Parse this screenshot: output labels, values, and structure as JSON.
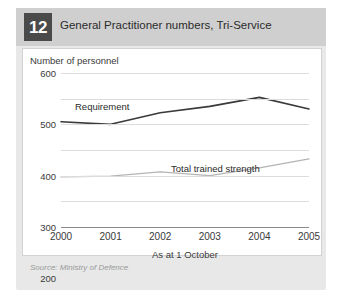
{
  "card": {
    "badge_number": "12",
    "title": "General Practitioner numbers, Tri-Service",
    "source": "Source: Ministry of Defence",
    "header_bg": "#cfcfcf",
    "badge_bg": "#4a4a4a",
    "card_bg": "#e8e8e8"
  },
  "chart_data": {
    "type": "line",
    "title": "General Practitioner numbers, Tri-Service",
    "xlabel": "As at 1 October",
    "ylabel": "Number of personnel",
    "categories": [
      "2000",
      "2001",
      "2002",
      "2003",
      "2004",
      "2005"
    ],
    "x": [
      2000,
      2001,
      2002,
      2003,
      2004,
      2005
    ],
    "ylim": [
      0,
      600
    ],
    "yticks": [
      "0",
      "100",
      "200",
      "300",
      "400",
      "500",
      "600"
    ],
    "ytick_values": [
      0,
      100,
      200,
      300,
      400,
      500,
      600
    ],
    "grid": true,
    "legend": "inline-labels",
    "series": [
      {
        "name": "Requirement",
        "color": "#3a3a3a",
        "values": [
          410,
          400,
          445,
          470,
          505,
          460
        ]
      },
      {
        "name": "Total trained strength",
        "color": "#b4b4b4",
        "values": [
          195,
          198,
          215,
          200,
          230,
          265
        ]
      }
    ],
    "annotations": [
      {
        "text": "Requirement",
        "series": "Requirement"
      },
      {
        "text": "Total trained strength",
        "series": "Total trained strength"
      }
    ]
  }
}
